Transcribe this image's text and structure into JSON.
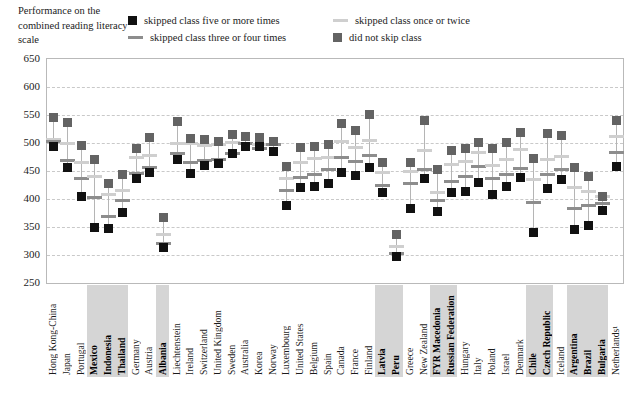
{
  "axis_title": "Performance on the combined reading literacy scale",
  "legend": [
    {
      "id": "five-or-more",
      "label": "skipped class five or more times",
      "marker": "square",
      "color": "#111111"
    },
    {
      "id": "once-or-twice",
      "label": "skipped class once or twice",
      "marker": "line",
      "color": "#cfcfcf"
    },
    {
      "id": "three-or-four",
      "label": "skipped class three or four times",
      "marker": "line",
      "color": "#8d8d8d"
    },
    {
      "id": "did-not-skip",
      "label": "did not skip class",
      "marker": "square",
      "color": "#636363"
    }
  ],
  "chart_data": {
    "type": "scatter",
    "title": "",
    "xlabel": "",
    "ylabel": "Performance on the combined reading literacy scale",
    "ylim": [
      250,
      650
    ],
    "yticks": [
      250,
      300,
      350,
      400,
      450,
      500,
      550,
      600,
      650
    ],
    "grid": true,
    "legend_position": "top",
    "series_names": [
      "skipped class five or more times",
      "skipped class three or four times",
      "skipped class once or twice",
      "did not skip class"
    ],
    "categories": [
      "Hong Kong-China",
      "Japan",
      "Portugal",
      "Mexico",
      "Indonesia",
      "Thailand",
      "Germany",
      "Austria",
      "Albania",
      "Liechtenstein",
      "Ireland",
      "Switzerland",
      "United Kingdom",
      "Sweden",
      "Australia",
      "Korea",
      "Norway",
      "Luxembourg",
      "United States",
      "Belgium",
      "Spain",
      "Canada",
      "France",
      "Finland",
      "Latvia",
      "Peru",
      "Greece",
      "New Zealand",
      "FYR Macedonia",
      "Russian Federation",
      "Hungary",
      "Italy",
      "Poland",
      "Israel",
      "Denmark",
      "Chile",
      "Czech Republic",
      "Iceland",
      "Argentina",
      "Brazil",
      "Bulgaria",
      "Netherlands¹"
    ],
    "highlighted": [
      "Mexico",
      "Indonesia",
      "Thailand",
      "Albania",
      "Latvia",
      "Peru",
      "FYR Macedonia",
      "Russian Federation",
      "Chile",
      "Czech Republic",
      "Argentina",
      "Brazil",
      "Bulgaria"
    ],
    "series": [
      {
        "name": "did not skip class",
        "values": [
          546,
          536,
          496,
          470,
          428,
          443,
          491,
          509,
          367,
          538,
          508,
          506,
          503,
          516,
          512,
          509,
          503,
          458,
          492,
          494,
          497,
          534,
          522,
          551,
          466,
          337,
          466,
          540,
          452,
          487,
          491,
          501,
          490,
          501,
          519,
          472,
          517,
          514,
          456,
          440,
          404,
          541
        ]
      },
      {
        "name": "skipped class once or twice",
        "values": [
          507,
          500,
          465,
          440,
          408,
          416,
          475,
          477,
          336,
          499,
          500,
          495,
          497,
          501,
          500,
          498,
          498,
          436,
          465,
          473,
          474,
          502,
          492,
          505,
          447,
          315,
          450,
          487,
          412,
          462,
          467,
          483,
          460,
          471,
          488,
          434,
          470,
          476,
          420,
          414,
          404,
          512
        ]
      },
      {
        "name": "skipped class three or four times",
        "values": [
          503,
          468,
          436,
          402,
          369,
          398,
          446,
          456,
          320,
          482,
          466,
          468,
          470,
          482,
          499,
          491,
          497,
          416,
          438,
          444,
          452,
          475,
          467,
          477,
          424,
          303,
          427,
          452,
          397,
          432,
          440,
          458,
          436,
          443,
          455,
          393,
          443,
          452,
          383,
          389,
          392,
          483
        ]
      },
      {
        "name": "skipped class five or more times",
        "values": [
          494,
          457,
          405,
          349,
          347,
          376,
          436,
          448,
          313,
          470,
          445,
          459,
          463,
          481,
          494,
          493,
          484,
          389,
          420,
          422,
          428,
          447,
          442,
          456,
          411,
          298,
          383,
          437,
          378,
          412,
          414,
          430,
          408,
          423,
          438,
          341,
          418,
          435,
          345,
          352,
          379,
          458
        ]
      }
    ]
  }
}
